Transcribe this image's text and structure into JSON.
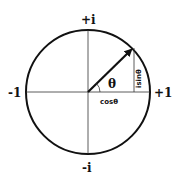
{
  "diagram": {
    "labels": {
      "top": "+i",
      "bottom": "-i",
      "left": "-1",
      "right": "+1",
      "angle": "θ",
      "horizontal_component": "cosθ",
      "vertical_component": "isinθ"
    },
    "colors": {
      "stroke": "#111111",
      "background": "#ffffff"
    }
  }
}
